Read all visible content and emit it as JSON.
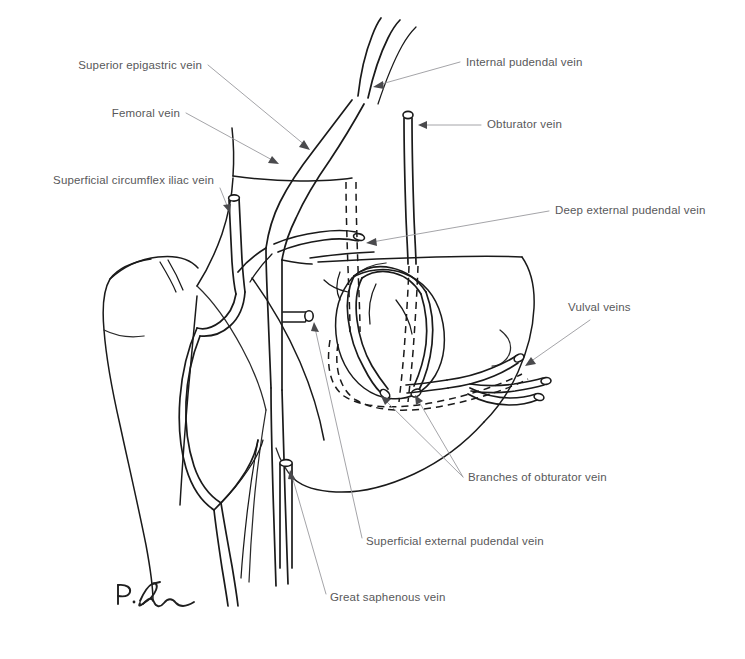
{
  "figure": {
    "kind": "anatomical-line-drawing",
    "background_color": "#ffffff",
    "ink_color": "#1a1a1a",
    "label_color": "#58585a",
    "leader_color": "#9a9a9e"
  },
  "labels": [
    {
      "id": "superior-epigastric-vein",
      "text": "Superior epigastric vein",
      "anchor": "end",
      "x": 202,
      "y": 69
    },
    {
      "id": "femoral-vein",
      "text": "Femoral vein",
      "anchor": "end",
      "x": 180,
      "y": 117
    },
    {
      "id": "superficial-circumflex-iliac-vein",
      "text": "Superficial circumflex iliac vein",
      "anchor": "end",
      "x": 214,
      "y": 184
    },
    {
      "id": "internal-pudendal-vein",
      "text": "Internal pudendal vein",
      "anchor": "start",
      "x": 466,
      "y": 66
    },
    {
      "id": "obturator-vein",
      "text": "Obturator vein",
      "anchor": "start",
      "x": 487,
      "y": 128
    },
    {
      "id": "deep-external-pudendal-vein",
      "text": "Deep external pudendal vein",
      "anchor": "start",
      "x": 555,
      "y": 214
    },
    {
      "id": "vulval-veins",
      "text": "Vulval veins",
      "anchor": "start",
      "x": 568,
      "y": 311
    },
    {
      "id": "branches-of-obturator-vein",
      "text": "Branches of obturator vein",
      "anchor": "start",
      "x": 468,
      "y": 481
    },
    {
      "id": "superficial-external-pudendal-vein",
      "text": "Superficial external pudendal vein",
      "anchor": "start",
      "x": 366,
      "y": 545
    },
    {
      "id": "great-saphenous-vein",
      "text": "Great saphenous vein",
      "anchor": "start",
      "x": 330,
      "y": 601
    }
  ],
  "signature": {
    "text": "P.D.",
    "description": "handwritten artist signature"
  }
}
